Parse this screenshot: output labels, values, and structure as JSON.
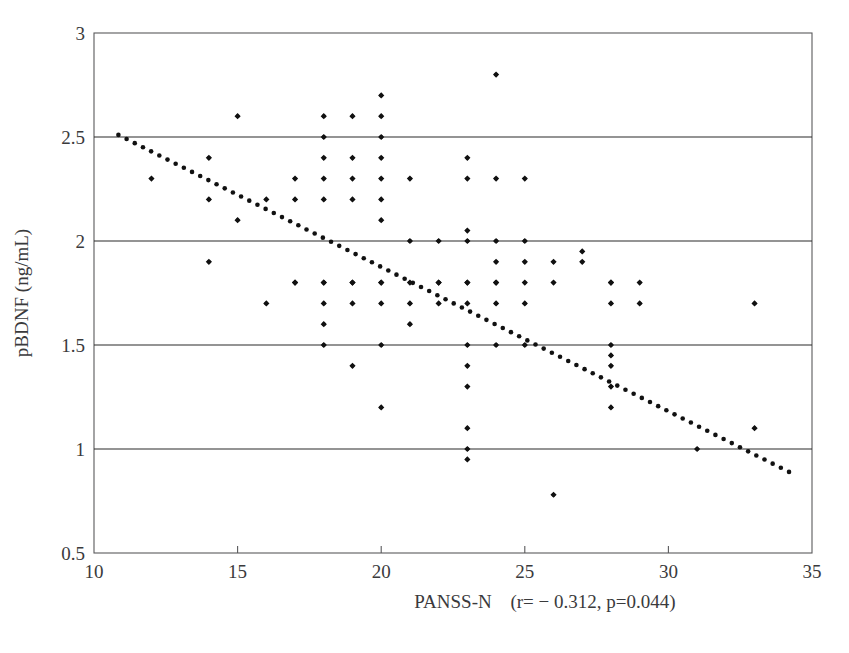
{
  "figure": {
    "background_color": "#ffffff",
    "point_color": "#111111",
    "grid_color": "#2a2a2a",
    "axis_color": "#59595b"
  },
  "axes": {
    "x_title": "PANSS-N",
    "y_title": "pBDNF (ng/mL)",
    "x_ticks": [
      "10",
      "15",
      "20",
      "25",
      "30",
      "35"
    ],
    "y_ticks": [
      "3",
      "2.5",
      "2",
      "1.5",
      "1",
      "0.5"
    ]
  },
  "annotation": {
    "statistics": "(r= − 0.312, p=0.044)"
  },
  "chart_data": {
    "type": "scatter",
    "title": "",
    "xlabel": "PANSS-N",
    "ylabel": "pBDNF (ng/mL)",
    "xlim": [
      10,
      35
    ],
    "ylim": [
      0.5,
      3
    ],
    "xticks": [
      10,
      15,
      20,
      25,
      30,
      35
    ],
    "yticks": [
      0.5,
      1,
      1.5,
      2,
      2.5,
      3
    ],
    "grid": "horizontal gridlines at y = 1, 1.5, 2, 2.5",
    "legend": "none",
    "annotations": [
      {
        "text": "(r= − 0.312, p=0.044)",
        "x": 26.5,
        "y": 0.42,
        "note": "correlation statistics printed below x-axis, right of axis label"
      }
    ],
    "correlation": {
      "r": -0.312,
      "p": 0.044
    },
    "trendline": {
      "type": "dotted-linear",
      "x_start": 10.85,
      "y_start": 2.51,
      "x_end": 34.2,
      "y_end": 0.89,
      "style": "dotted",
      "color": "#111111"
    },
    "points": [
      {
        "x": 12,
        "y": 2.3
      },
      {
        "x": 14,
        "y": 2.4
      },
      {
        "x": 14,
        "y": 2.2
      },
      {
        "x": 14,
        "y": 1.9
      },
      {
        "x": 15,
        "y": 2.6
      },
      {
        "x": 15,
        "y": 2.1
      },
      {
        "x": 16,
        "y": 2.2
      },
      {
        "x": 16,
        "y": 1.7
      },
      {
        "x": 17,
        "y": 2.3
      },
      {
        "x": 17,
        "y": 2.2
      },
      {
        "x": 17,
        "y": 1.8
      },
      {
        "x": 17,
        "y": 1.8
      },
      {
        "x": 18,
        "y": 2.6
      },
      {
        "x": 18,
        "y": 2.5
      },
      {
        "x": 18,
        "y": 2.4
      },
      {
        "x": 18,
        "y": 2.3
      },
      {
        "x": 18,
        "y": 2.2
      },
      {
        "x": 18,
        "y": 1.8
      },
      {
        "x": 18,
        "y": 1.8
      },
      {
        "x": 18,
        "y": 1.7
      },
      {
        "x": 18,
        "y": 1.6
      },
      {
        "x": 18,
        "y": 1.5
      },
      {
        "x": 19,
        "y": 2.6
      },
      {
        "x": 19,
        "y": 2.4
      },
      {
        "x": 19,
        "y": 2.3
      },
      {
        "x": 19,
        "y": 2.2
      },
      {
        "x": 19,
        "y": 1.8
      },
      {
        "x": 19,
        "y": 1.8
      },
      {
        "x": 19,
        "y": 1.7
      },
      {
        "x": 19,
        "y": 1.4
      },
      {
        "x": 20,
        "y": 2.7
      },
      {
        "x": 20,
        "y": 2.6
      },
      {
        "x": 20,
        "y": 2.5
      },
      {
        "x": 20,
        "y": 2.4
      },
      {
        "x": 20,
        "y": 2.3
      },
      {
        "x": 20,
        "y": 2.2
      },
      {
        "x": 20,
        "y": 2.1
      },
      {
        "x": 20,
        "y": 1.8
      },
      {
        "x": 20,
        "y": 1.8
      },
      {
        "x": 20,
        "y": 1.7
      },
      {
        "x": 20,
        "y": 1.5
      },
      {
        "x": 20,
        "y": 1.2
      },
      {
        "x": 21,
        "y": 2.3
      },
      {
        "x": 21,
        "y": 2.0
      },
      {
        "x": 21,
        "y": 1.8
      },
      {
        "x": 21,
        "y": 1.7
      },
      {
        "x": 21,
        "y": 1.6
      },
      {
        "x": 22,
        "y": 2.0
      },
      {
        "x": 22,
        "y": 1.8
      },
      {
        "x": 22,
        "y": 1.8
      },
      {
        "x": 22,
        "y": 1.7
      },
      {
        "x": 23,
        "y": 2.4
      },
      {
        "x": 23,
        "y": 2.3
      },
      {
        "x": 23,
        "y": 2.05
      },
      {
        "x": 23,
        "y": 2.0
      },
      {
        "x": 23,
        "y": 1.8
      },
      {
        "x": 23,
        "y": 1.8
      },
      {
        "x": 23,
        "y": 1.7
      },
      {
        "x": 23,
        "y": 1.5
      },
      {
        "x": 23,
        "y": 1.4
      },
      {
        "x": 23,
        "y": 1.3
      },
      {
        "x": 23,
        "y": 1.1
      },
      {
        "x": 23,
        "y": 1.0
      },
      {
        "x": 23,
        "y": 0.95
      },
      {
        "x": 24,
        "y": 2.8
      },
      {
        "x": 24,
        "y": 2.3
      },
      {
        "x": 24,
        "y": 2.0
      },
      {
        "x": 24,
        "y": 1.9
      },
      {
        "x": 24,
        "y": 1.8
      },
      {
        "x": 24,
        "y": 1.8
      },
      {
        "x": 24,
        "y": 1.7
      },
      {
        "x": 24,
        "y": 1.5
      },
      {
        "x": 25,
        "y": 2.3
      },
      {
        "x": 25,
        "y": 2.0
      },
      {
        "x": 25,
        "y": 1.9
      },
      {
        "x": 25,
        "y": 1.8
      },
      {
        "x": 25,
        "y": 1.7
      },
      {
        "x": 25,
        "y": 1.5
      },
      {
        "x": 26,
        "y": 1.9
      },
      {
        "x": 26,
        "y": 1.8
      },
      {
        "x": 26,
        "y": 0.78
      },
      {
        "x": 27,
        "y": 1.95
      },
      {
        "x": 27,
        "y": 1.9
      },
      {
        "x": 28,
        "y": 1.8
      },
      {
        "x": 28,
        "y": 1.8
      },
      {
        "x": 28,
        "y": 1.7
      },
      {
        "x": 28,
        "y": 1.5
      },
      {
        "x": 28,
        "y": 1.45
      },
      {
        "x": 28,
        "y": 1.4
      },
      {
        "x": 28,
        "y": 1.3
      },
      {
        "x": 28,
        "y": 1.2
      },
      {
        "x": 29,
        "y": 1.8
      },
      {
        "x": 29,
        "y": 1.7
      },
      {
        "x": 31,
        "y": 1.0
      },
      {
        "x": 33,
        "y": 1.7
      },
      {
        "x": 33,
        "y": 1.1
      }
    ]
  }
}
